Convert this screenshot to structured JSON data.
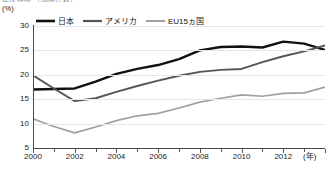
{
  "title_sliver": "年次推移  （国際比較）",
  "unit_label": "(%)",
  "legend": {
    "items": [
      {
        "label": "日本",
        "color": "#111111",
        "width": 2.6
      },
      {
        "label": "アメリカ",
        "color": "#555555",
        "width": 2.0
      },
      {
        "label": "EU15ヵ国",
        "color": "#a0a0a0",
        "width": 1.8
      }
    ]
  },
  "axis": {
    "y_ticks": [
      "30",
      "25",
      "20",
      "15",
      "10",
      "5"
    ],
    "x_ticks": [
      "2000",
      "2002",
      "2004",
      "2006",
      "2008",
      "2010",
      "2012"
    ],
    "x_unit": "(年)"
  },
  "chart_data": {
    "type": "line",
    "title": "年次推移  （国際比較）",
    "xlabel": "(年)",
    "ylabel": "(%)",
    "xlim": [
      2000,
      2014
    ],
    "ylim": [
      5,
      30
    ],
    "grid": true,
    "legend_position": "top-left",
    "x": [
      2000,
      2001,
      2002,
      2003,
      2004,
      2005,
      2006,
      2007,
      2008,
      2009,
      2010,
      2011,
      2012,
      2013,
      2014
    ],
    "series": [
      {
        "name": "日本",
        "color": "#111111",
        "values": [
          17.0,
          17.1,
          17.2,
          18.6,
          20.2,
          21.2,
          22.0,
          23.2,
          25.0,
          25.7,
          25.8,
          25.6,
          26.8,
          26.4,
          25.1
        ]
      },
      {
        "name": "アメリカ",
        "color": "#555555",
        "values": [
          19.9,
          17.2,
          14.6,
          15.2,
          16.5,
          17.7,
          18.8,
          19.8,
          20.6,
          21.0,
          21.2,
          22.6,
          23.8,
          24.8,
          26.0
        ]
      },
      {
        "name": "EU15ヵ国",
        "color": "#a0a0a0",
        "values": [
          11.0,
          9.4,
          8.1,
          9.3,
          10.6,
          11.6,
          12.1,
          13.2,
          14.4,
          15.2,
          15.9,
          15.6,
          16.2,
          16.3,
          17.5
        ]
      }
    ]
  }
}
